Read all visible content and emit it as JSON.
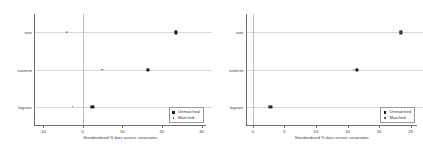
{
  "figure": {
    "panel_count": 2
  },
  "chart_data": [
    {
      "type": "scatter",
      "panel": "left",
      "title": "",
      "xlabel": "Standardized % bias across covariates",
      "ylabel": "",
      "xlim": [
        -12,
        31
      ],
      "ylim": [
        0,
        3
      ],
      "grid": "horizontal-row-lines",
      "reference_line_x": 0,
      "xticks": [
        -10,
        0,
        10,
        20,
        30
      ],
      "xticklabels": [
        "-10",
        "0",
        "10",
        "20",
        "30"
      ],
      "categories": [
        "rate",
        "isoterm",
        "logsize"
      ],
      "legend_position": "lower-right",
      "series": [
        {
          "name": "Unmatched",
          "marker": "filled-square",
          "values": [
            23.5,
            16.5,
            2.5
          ]
        },
        {
          "name": "Matched",
          "marker": "small-dot",
          "values": [
            -4.0,
            5.0,
            -2.5
          ]
        }
      ]
    },
    {
      "type": "scatter",
      "panel": "right",
      "title": "",
      "xlabel": "Standardized % bias across covariates",
      "ylabel": "",
      "xlim": [
        -1,
        26
      ],
      "ylim": [
        0,
        3
      ],
      "grid": "horizontal-row-lines",
      "reference_line_x": 0,
      "xticks": [
        0,
        5,
        10,
        15,
        20,
        25
      ],
      "xticklabels": [
        "0",
        "5",
        "10",
        "15",
        "20",
        "25"
      ],
      "categories": [
        "rate",
        "isoterm",
        "logsize"
      ],
      "legend_position": "lower-right",
      "series": [
        {
          "name": "Unmatched",
          "marker": "filled-square",
          "values": [
            23.5,
            16.5,
            2.8
          ]
        },
        {
          "name": "Matched",
          "marker": "small-dot",
          "values": [
            23.3,
            16.0,
            2.8
          ]
        }
      ]
    }
  ]
}
